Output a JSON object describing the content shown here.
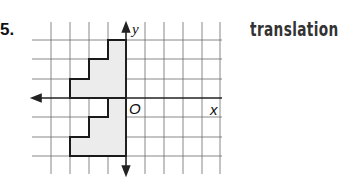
{
  "problem": {
    "number": "5.",
    "transformation_label": "translation"
  },
  "graph": {
    "x_axis_label": "x",
    "y_axis_label": "y",
    "origin_label": "O",
    "grid": {
      "x_range": [
        -5,
        5
      ],
      "y_range": [
        -3,
        3
      ],
      "unit_px": 19
    },
    "figures": [
      {
        "name": "preimage-upper",
        "vertices": [
          [
            -3,
            0
          ],
          [
            -3,
            1
          ],
          [
            -2,
            1
          ],
          [
            -2,
            2
          ],
          [
            -1,
            2
          ],
          [
            -1,
            3
          ],
          [
            0,
            3
          ],
          [
            0,
            0
          ]
        ]
      },
      {
        "name": "image-lower",
        "vertices": [
          [
            -3,
            -3
          ],
          [
            -3,
            -2
          ],
          [
            -2,
            -2
          ],
          [
            -2,
            -1
          ],
          [
            -1,
            -1
          ],
          [
            -1,
            0
          ],
          [
            0,
            0
          ],
          [
            0,
            -3
          ]
        ]
      }
    ],
    "colors": {
      "grid": "#555555",
      "axis": "#222222",
      "fill": "#ececec",
      "outline": "#1a1a1a"
    }
  }
}
